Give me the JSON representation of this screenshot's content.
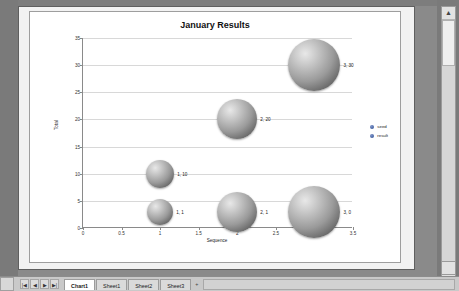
{
  "window": {
    "scroll_up_icon": "▲",
    "scroll_down_icon": "▼",
    "scroll_extra_icon": "▣"
  },
  "chart_data": {
    "type": "scatter",
    "title": "January Results",
    "xlabel": "Sequence",
    "ylabel": "Total",
    "xlim": [
      0,
      3.5
    ],
    "ylim": [
      0,
      35
    ],
    "xticks": [
      "0",
      "0.5",
      "1",
      "1.5",
      "2",
      "2.5",
      "3",
      "3.5"
    ],
    "yticks": [
      "0",
      "5",
      "10",
      "15",
      "20",
      "25",
      "30",
      "35"
    ],
    "grid": true,
    "legend_position": "right",
    "legend": [
      {
        "label": "seed",
        "color": "#2f4f91"
      },
      {
        "label": "result",
        "color": "#2f4f91"
      }
    ],
    "points": [
      {
        "label": "1, 1",
        "x": 1,
        "y": 3,
        "size": 1
      },
      {
        "label": "1, 10",
        "x": 1,
        "y": 10,
        "size": 10
      },
      {
        "label": "2, 1",
        "x": 2,
        "y": 3,
        "size": 20
      },
      {
        "label": "2, 20",
        "x": 2,
        "y": 20,
        "size": 20
      },
      {
        "label": "3, 0",
        "x": 3,
        "y": 3,
        "size": 30
      },
      {
        "label": "3, 30",
        "x": 3,
        "y": 30,
        "size": 30
      }
    ]
  },
  "tabbar": {
    "nav": [
      "|◀",
      "◀",
      "▶",
      "▶|"
    ],
    "tabs": [
      {
        "label": "Chart1",
        "active": true
      },
      {
        "label": "Sheet1",
        "active": false
      },
      {
        "label": "Sheet2",
        "active": false
      },
      {
        "label": "Sheet3",
        "active": false
      }
    ],
    "extra": "+"
  }
}
